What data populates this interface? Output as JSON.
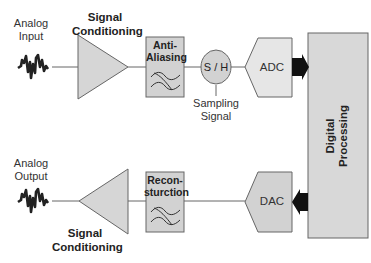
{
  "diagram": {
    "type": "signal-chain-block-diagram",
    "input_path": {
      "analog_input_label": "Analog Input",
      "analog_input_line1": "Analog",
      "analog_input_line2": "Input",
      "signal_conditioning_line1": "Signal",
      "signal_conditioning_line2": "Conditioning",
      "anti_aliasing_line1": "Anti-",
      "anti_aliasing_line2": "Aliasing",
      "sample_hold": "S / H",
      "sampling_signal_line1": "Sampling",
      "sampling_signal_line2": "Signal",
      "adc": "ADC"
    },
    "processing": {
      "line1": "Digital",
      "line2": "Processing"
    },
    "output_path": {
      "analog_output_line1": "Analog",
      "analog_output_line2": "Output",
      "signal_conditioning_line1": "Signal",
      "signal_conditioning_line2": "Conditioning",
      "reconstruction_line1": "Recon-",
      "reconstruction_line2": "sturction",
      "dac": "DAC"
    },
    "colors": {
      "block_fill": "#d4d4d4",
      "block_fill_light": "#e4e4e4",
      "stroke": "#555555",
      "arrow": "#111111"
    }
  }
}
